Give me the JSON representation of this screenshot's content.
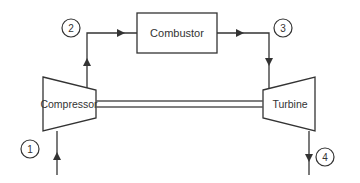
{
  "diagram": {
    "components": {
      "compressor": {
        "label": "Compressor"
      },
      "combustor": {
        "label": "Combustor"
      },
      "turbine": {
        "label": "Turbine"
      }
    },
    "state_points": [
      {
        "id": "1",
        "label": "1"
      },
      {
        "id": "2",
        "label": "2"
      },
      {
        "id": "3",
        "label": "3"
      },
      {
        "id": "4",
        "label": "4"
      }
    ],
    "flows": [
      {
        "from": "inlet",
        "to": "compressor",
        "state": "1"
      },
      {
        "from": "compressor",
        "to": "combustor",
        "state": "2"
      },
      {
        "from": "combustor",
        "to": "turbine",
        "state": "3"
      },
      {
        "from": "turbine",
        "to": "exhaust",
        "state": "4"
      }
    ],
    "shaft": {
      "connects": [
        "compressor",
        "turbine"
      ]
    },
    "colors": {
      "stroke": "#333333",
      "background": "#ffffff"
    }
  }
}
